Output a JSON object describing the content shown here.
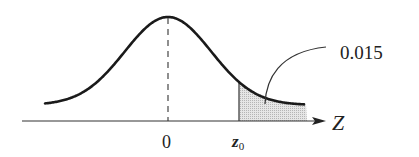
{
  "chart_data": {
    "type": "area",
    "title": "",
    "xlabel": "Z",
    "ylabel": "",
    "x_ticks": [
      "0",
      "z0"
    ],
    "mean": 0,
    "shaded_region": {
      "from": "z0",
      "to": "+inf",
      "area": 0.015
    },
    "annotation": "0.015",
    "grid": false,
    "legend": "none"
  },
  "labels": {
    "axis": "Z",
    "tick_zero": "0",
    "tick_z": "z",
    "tick_z_sub": "0",
    "area_value": "0.015"
  },
  "colors": {
    "curve": "#1a1a1a",
    "shade": "#d4d4d4",
    "axis": "#333333"
  }
}
